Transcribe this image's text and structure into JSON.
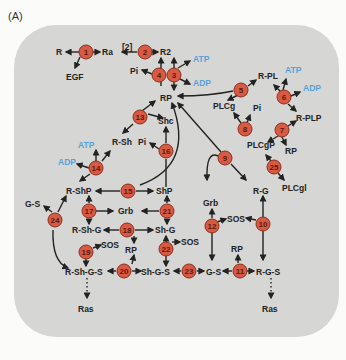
{
  "panel_label": "(A)",
  "colors": {
    "background": "#d6d6d4",
    "node_fill": "#d85a42",
    "species_text": "#222222",
    "atp_adp_text": "#5aa0d8"
  },
  "reactions": [
    "1",
    "2",
    "3",
    "4",
    "5",
    "6",
    "7",
    "8",
    "9",
    "10",
    "11",
    "12",
    "13",
    "14",
    "15",
    "16",
    "17",
    "18",
    "19",
    "20",
    "21",
    "22",
    "23",
    "24",
    "25"
  ],
  "species": {
    "R": "R",
    "Ra": "Ra",
    "EGF": "EGF",
    "stoich_2": "[2]",
    "R2": "R2",
    "ATP_3": "ATP",
    "ADP_3": "ADP",
    "Pi_4": "Pi",
    "RP": "RP",
    "R_PL": "R-PL",
    "ATP_6": "ATP",
    "ADP_6": "ADP",
    "PLCg": "PLCg",
    "Pi_8": "Pi",
    "R_PLP": "R-PLP",
    "PLCgP": "PLCgP",
    "RP_7": "RP",
    "PLCgl": "PLCgl",
    "Shc": "Shc",
    "R_Sh": "R-Sh",
    "Pi_16": "Pi",
    "ATP_14": "ATP",
    "ADP_14": "ADP",
    "R_ShP": "R-ShP",
    "ShP": "ShP",
    "Grb_17": "Grb",
    "G_S_24": "G-S",
    "R_Sh_G": "R-Sh-G",
    "Sh_G": "Sh-G",
    "SOS_19": "SOS",
    "RP_18": "RP",
    "SOS_22": "SOS",
    "R_Sh_G_S": "R-Sh-G-S",
    "Sh_G_S": "Sh-G-S",
    "G_S": "G-S",
    "R_G_S": "R-G-S",
    "RP_11": "RP",
    "Grb_12": "Grb",
    "SOS_12": "SOS",
    "R_G": "R-G",
    "Ras_left": "Ras",
    "Ras_right": "Ras"
  }
}
